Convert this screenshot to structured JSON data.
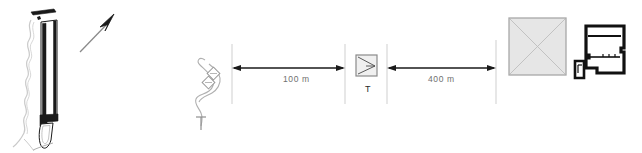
{
  "drawing": {
    "type": "architectural-site-plan",
    "background_color": "#ffffff",
    "line_color": "#1a1a1a",
    "light_line_color": "#b9b9b9",
    "fill_gray": "#e6e6e6",
    "text_color": "#6f6f6f"
  },
  "wall_section": {
    "name": "wall-section-detail",
    "description": "vertical wall section with foundation footing and terrain contour"
  },
  "north_arrow": {
    "name": "north-arrow",
    "direction": "up-right"
  },
  "path_symbol": {
    "name": "winding-path",
    "description": "winding access path with two diamond markers"
  },
  "dimensions": [
    {
      "id": "dim-100",
      "label": "100 m",
      "arrow_left": true,
      "arrow_right": true
    },
    {
      "id": "dim-400",
      "label": "400 m",
      "arrow_left": true,
      "arrow_right": true
    }
  ],
  "symbols": {
    "transformer": {
      "name": "transformer-symbol",
      "label": "T"
    },
    "hipped_roof_building": {
      "name": "hipped-roof-building",
      "label": ""
    },
    "floor_plan": {
      "name": "building-floor-plan",
      "label": ""
    },
    "small_outbuilding": {
      "name": "small-outbuilding",
      "label": ""
    }
  }
}
